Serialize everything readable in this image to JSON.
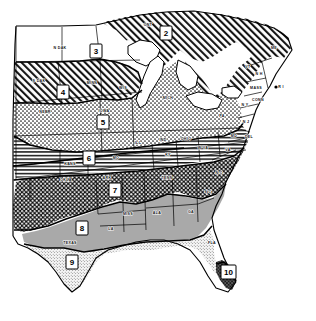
{
  "map": {
    "title": "Plant Hardiness Zone Map of the Eastern United States",
    "style": "black-and-white line-engraved zone map",
    "background_color": "#ffffff",
    "line_color": "#000000",
    "zones": [
      {
        "number": "2",
        "label_x": 166,
        "label_y": 33,
        "pattern": "diagonal-hatch",
        "fill_hint": "#ffffff"
      },
      {
        "number": "3",
        "label_x": 96,
        "label_y": 51,
        "pattern": "plain-white",
        "fill_hint": "#ffffff"
      },
      {
        "number": "4",
        "label_x": 63,
        "label_y": 92,
        "pattern": "diagonal-hatch",
        "fill_hint": "#ffffff"
      },
      {
        "number": "5",
        "label_x": 103,
        "label_y": 122,
        "pattern": "stipple-dots",
        "fill_hint": "#ffffff"
      },
      {
        "number": "6",
        "label_x": 89,
        "label_y": 158,
        "pattern": "horizontal-lines",
        "fill_hint": "#ffffff"
      },
      {
        "number": "7",
        "label_x": 115,
        "label_y": 190,
        "pattern": "dark-crosshatch",
        "fill_hint": "#2b2b2b"
      },
      {
        "number": "8",
        "label_x": 82,
        "label_y": 228,
        "pattern": "solid-gray",
        "fill_hint": "#a8a8a8"
      },
      {
        "number": "9",
        "label_x": 72,
        "label_y": 262,
        "pattern": "fine-stipple",
        "fill_hint": "#e4e4e4"
      },
      {
        "number": "10",
        "label_x": 229,
        "label_y": 272,
        "pattern": "near-black",
        "fill_hint": "#3a3a3a"
      }
    ],
    "states": [
      {
        "abbr": "N DAK",
        "x": 60,
        "y": 48
      },
      {
        "abbr": "S DAK",
        "x": 39,
        "y": 81
      },
      {
        "abbr": "NEBR",
        "x": 45,
        "y": 112
      },
      {
        "abbr": "MINN",
        "x": 92,
        "y": 83
      },
      {
        "abbr": "WIS",
        "x": 123,
        "y": 88
      },
      {
        "abbr": "IOWA",
        "x": 104,
        "y": 111
      },
      {
        "abbr": "ONT",
        "x": 148,
        "y": 25
      },
      {
        "abbr": "MICH",
        "x": 168,
        "y": 98
      },
      {
        "abbr": "ILL",
        "x": 138,
        "y": 143
      },
      {
        "abbr": "IND",
        "x": 163,
        "y": 140
      },
      {
        "abbr": "OHIO",
        "x": 186,
        "y": 139
      },
      {
        "abbr": "KY",
        "x": 168,
        "y": 155
      },
      {
        "abbr": "MO",
        "x": 116,
        "y": 158
      },
      {
        "abbr": "KANS",
        "x": 70,
        "y": 164
      },
      {
        "abbr": "OKLA",
        "x": 66,
        "y": 180
      },
      {
        "abbr": "ARK",
        "x": 107,
        "y": 178
      },
      {
        "abbr": "TENN",
        "x": 167,
        "y": 178
      },
      {
        "abbr": "MISS",
        "x": 128,
        "y": 214
      },
      {
        "abbr": "ALA",
        "x": 157,
        "y": 213
      },
      {
        "abbr": "GA",
        "x": 191,
        "y": 212
      },
      {
        "abbr": "LA",
        "x": 111,
        "y": 229
      },
      {
        "abbr": "TEXAS",
        "x": 70,
        "y": 243
      },
      {
        "abbr": "FLA",
        "x": 212,
        "y": 243
      },
      {
        "abbr": "S C",
        "x": 208,
        "y": 192
      },
      {
        "abbr": "N C",
        "x": 219,
        "y": 173
      },
      {
        "abbr": "VA",
        "x": 228,
        "y": 150
      },
      {
        "abbr": "W VA",
        "x": 203,
        "y": 148
      },
      {
        "abbr": "PA",
        "x": 222,
        "y": 116
      },
      {
        "abbr": "MD",
        "x": 234,
        "y": 136
      },
      {
        "abbr": "DEL",
        "x": 249,
        "y": 137
      },
      {
        "abbr": "N J",
        "x": 246,
        "y": 122
      },
      {
        "abbr": "N Y",
        "x": 245,
        "y": 105
      },
      {
        "abbr": "CONN",
        "x": 258,
        "y": 100
      },
      {
        "abbr": "MASS",
        "x": 256,
        "y": 88
      },
      {
        "abbr": "R I",
        "x": 281,
        "y": 87
      },
      {
        "abbr": "N H",
        "x": 259,
        "y": 74
      },
      {
        "abbr": "VT",
        "x": 248,
        "y": 67
      },
      {
        "abbr": "ME",
        "x": 274,
        "y": 48
      }
    ]
  }
}
